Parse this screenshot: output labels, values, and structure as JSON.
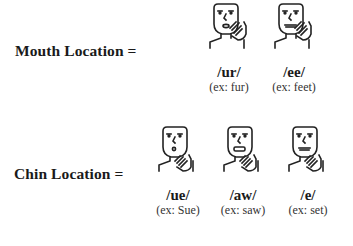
{
  "rows": [
    {
      "label": "Mouth Location =",
      "items": [
        {
          "sound": "/ur/",
          "example": "(ex: fur)",
          "mouth": "oval",
          "icon": "face-hand-mouth-icon"
        },
        {
          "sound": "/ee/",
          "example": "(ex: feet)",
          "mouth": "wide",
          "icon": "face-hand-mouth-icon"
        }
      ]
    },
    {
      "label": "Chin Location =",
      "items": [
        {
          "sound": "/ue/",
          "example": "(ex: Sue)",
          "mouth": "small-o",
          "icon": "face-hand-chin-icon"
        },
        {
          "sound": "/aw/",
          "example": "(ex: saw)",
          "mouth": "open-rect",
          "icon": "face-hand-chin-icon"
        },
        {
          "sound": "/e/",
          "example": "(ex: set)",
          "mouth": "flat",
          "icon": "face-hand-chin-icon"
        }
      ]
    }
  ]
}
